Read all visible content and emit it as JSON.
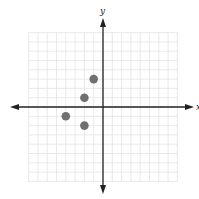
{
  "chart_data": {
    "type": "scatter",
    "title": "",
    "xlabel": "x",
    "ylabel": "y",
    "xlim": [
      -8,
      8
    ],
    "ylim": [
      -8,
      8
    ],
    "grid": true,
    "legend": null,
    "series": [
      {
        "name": "points",
        "color": "#707070",
        "points": [
          {
            "x": -1,
            "y": 3
          },
          {
            "x": -2,
            "y": 1
          },
          {
            "x": -4,
            "y": -1
          },
          {
            "x": -2,
            "y": -2
          }
        ]
      }
    ]
  },
  "labels": {
    "x_axis": "x",
    "y_axis": "y"
  },
  "colors": {
    "grid": "#e3e3e3",
    "axis": "#222222",
    "point": "#707070"
  }
}
